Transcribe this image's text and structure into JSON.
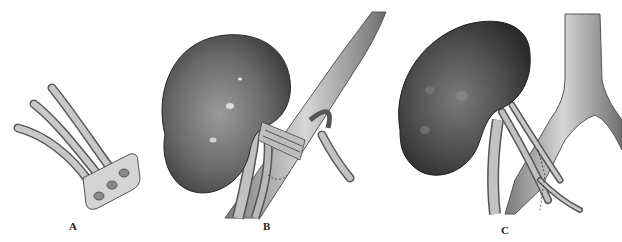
{
  "figure": {
    "panels": [
      {
        "id": "A",
        "label": "A",
        "subject": "vascular-patch-with-three-vessels"
      },
      {
        "id": "B",
        "label": "B",
        "subject": "kidney-with-vessels-anastomosed-patch"
      },
      {
        "id": "C",
        "label": "C",
        "subject": "kidney-with-vessels-crossed-anastomosis"
      }
    ],
    "colors": {
      "background": "#ffffff",
      "kidney_dark": "#3a3a3a",
      "kidney_mid": "#6a6a6a",
      "vessel_light": "#bdbdbd",
      "vessel_mid": "#8c8c8c",
      "outline": "#2a2a2a",
      "label": "#222222"
    }
  }
}
